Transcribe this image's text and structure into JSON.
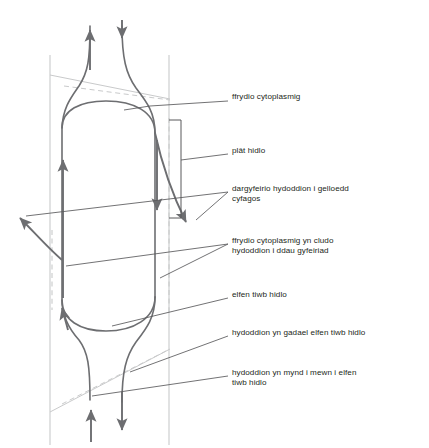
{
  "figure": {
    "background_color": "#ffffff",
    "line_color": "#6d6e71",
    "wall_color": "#c8c9ca",
    "text_color": "#231f20",
    "leader_color": "#58595b"
  },
  "labels": [
    {
      "id": "ffrydio-cytoplasmig",
      "text": "ffrydio cytoplasmig",
      "x": 232,
      "y": 96
    },
    {
      "id": "plat-hidlo",
      "text": "plât hidlo",
      "x": 232,
      "y": 150
    },
    {
      "id": "dargyfeirio-hydoddion",
      "line1": "dargyfeirio hydoddion i gelloedd",
      "line2": "cyfagos",
      "x": 232,
      "y": 188
    },
    {
      "id": "ffrydio-dau-gyfeiriad",
      "line1": "ffrydio cytoplasmig yn cludo",
      "line2": "hydoddion i ddau gyfeiriad",
      "x": 232,
      "y": 239
    },
    {
      "id": "elfen-tiwb-hidlo",
      "text": "elfen tiwb hidlo",
      "x": 232,
      "y": 294
    },
    {
      "id": "hydoddion-gadael",
      "text": "hydoddion yn gadael elfen tiwb hidlo",
      "x": 232,
      "y": 332
    },
    {
      "id": "hydoddion-mynd-i-mewn",
      "line1": "hydoddion yn mynd i mewn i elfen",
      "line2": "tiwb hidlo",
      "x": 232,
      "y": 371
    }
  ],
  "diagram_elements": {
    "cell_walls": [
      {
        "id": "left-wall",
        "x": 50,
        "y1": 55,
        "y2": 445
      },
      {
        "id": "right-wall",
        "x": 169,
        "y1": 55,
        "y2": 445
      }
    ],
    "dashed_wall": {
      "id": "dashed-inner-wall",
      "x": 169,
      "y1": 120,
      "y2": 310
    },
    "sieve_plate_bracket": {
      "x": 181,
      "y1": 120,
      "y2": 218
    },
    "arrows": [
      {
        "id": "top-outflow-arrow",
        "direction": "up",
        "position": "top-left"
      },
      {
        "id": "top-inflow-arrow",
        "direction": "down",
        "position": "top-right"
      },
      {
        "id": "interior-upward-stream-arrow",
        "direction": "up",
        "position": "interior-left"
      },
      {
        "id": "interior-downward-stream-arrow",
        "direction": "down",
        "position": "interior-middle"
      },
      {
        "id": "solute-diversion-right-arrow",
        "direction": "down-right",
        "position": "right-side"
      },
      {
        "id": "solute-diversion-left-arrow",
        "direction": "left",
        "position": "far-left"
      },
      {
        "id": "lower-left-inflow-arrow",
        "direction": "up",
        "position": "lower-left"
      },
      {
        "id": "bottom-inflow-arrow",
        "direction": "up",
        "position": "bottom-left"
      },
      {
        "id": "bottom-outflow-arrow",
        "direction": "down",
        "position": "bottom-right"
      }
    ]
  }
}
